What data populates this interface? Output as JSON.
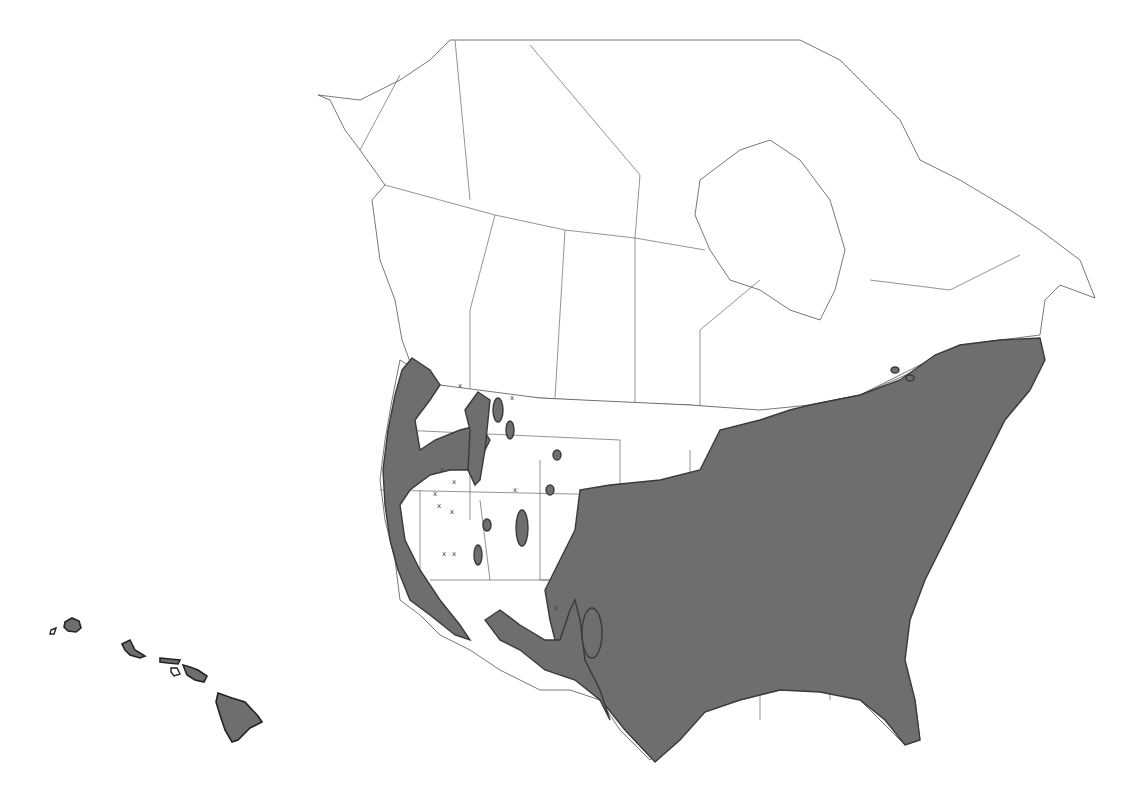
{
  "map": {
    "type": "species range map",
    "region": "North America (United States and Canada) with Hawaii inset",
    "colors": {
      "range_fill": "#6e6e6e",
      "range_outline": "#3a3a3a",
      "background": "#ffffff",
      "borders": "#666666"
    },
    "legend": null,
    "labels": []
  }
}
